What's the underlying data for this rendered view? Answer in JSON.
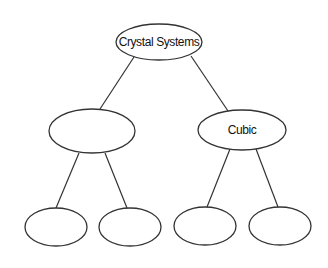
{
  "diagram": {
    "type": "tree",
    "nodes": [
      {
        "id": "root",
        "label": "Crystal Systems",
        "cx": 159,
        "cy": 42,
        "rx": 43,
        "ry": 18
      },
      {
        "id": "left",
        "label": "",
        "cx": 92,
        "cy": 131,
        "rx": 43,
        "ry": 22
      },
      {
        "id": "cubic",
        "label": "Cubic",
        "cx": 242,
        "cy": 130,
        "rx": 44,
        "ry": 20
      },
      {
        "id": "left-left",
        "label": "",
        "cx": 56,
        "cy": 227,
        "rx": 31,
        "ry": 19
      },
      {
        "id": "left-right",
        "label": "",
        "cx": 130,
        "cy": 227,
        "rx": 31,
        "ry": 19
      },
      {
        "id": "cubic-left",
        "label": "",
        "cx": 205,
        "cy": 226,
        "rx": 31,
        "ry": 19
      },
      {
        "id": "cubic-right",
        "label": "",
        "cx": 280,
        "cy": 226,
        "rx": 31,
        "ry": 19
      }
    ],
    "edges": [
      {
        "from": "root",
        "to": "left"
      },
      {
        "from": "root",
        "to": "cubic"
      },
      {
        "from": "left",
        "to": "left-left"
      },
      {
        "from": "left",
        "to": "left-right"
      },
      {
        "from": "cubic",
        "to": "cubic-left"
      },
      {
        "from": "cubic",
        "to": "cubic-right"
      }
    ]
  }
}
